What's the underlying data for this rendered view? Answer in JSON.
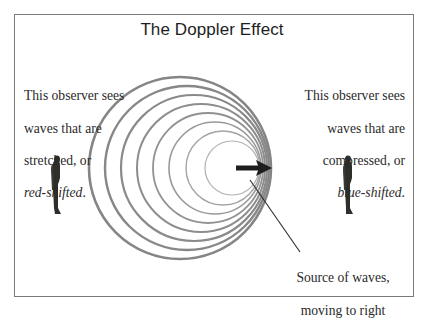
{
  "title": "The Doppler Effect",
  "left_caption": {
    "line1": "This observer sees",
    "line2": "waves that are",
    "line3": "stretched, or",
    "italic": "red-shifted",
    "suffix": "."
  },
  "right_caption": {
    "line1": "This observer sees",
    "line2": "waves that are",
    "line3": "compressed, or",
    "italic": "blue-shifted",
    "suffix": "."
  },
  "source_caption": {
    "line1": "Source of waves,",
    "line2": "moving to right"
  },
  "figures": {
    "left_observer": "observer-figure",
    "right_observer": "observer-figure"
  },
  "colors": {
    "wave_stroke": "#8a8a8a",
    "frame": "#7a7a7a",
    "arrow": "#1e1e1e",
    "text": "#2a2a2a"
  }
}
